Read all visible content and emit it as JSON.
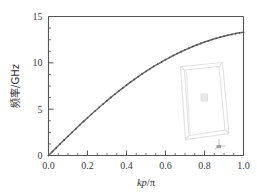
{
  "figure": {
    "background_color": "#ffffff",
    "frame_color": "#555555",
    "curve_color": "#6b6b6b",
    "marker_color": "#4a4a4a",
    "inset_color": "#dcdcdc"
  },
  "chart_data": {
    "type": "line",
    "title": "",
    "subtitle": "",
    "xlabel": "kp/π",
    "xlabel_parts": {
      "italic": "kp",
      "slash": "/",
      "symbol": "π"
    },
    "ylabel": "频率/GHz",
    "xlim": [
      0.0,
      1.0
    ],
    "ylim": [
      0,
      15
    ],
    "xticks": [
      0.0,
      0.2,
      0.4,
      0.6,
      0.8,
      1.0
    ],
    "xticklabels": [
      "0.0",
      "0.2",
      "0.4",
      "0.6",
      "0.8",
      "1.0"
    ],
    "yticks": [
      0,
      5,
      10,
      15
    ],
    "yticklabels": [
      "0",
      "5",
      "10",
      "15"
    ],
    "x_minor_ticks": [
      0.05,
      0.1,
      0.15,
      0.25,
      0.3,
      0.35,
      0.45,
      0.5,
      0.55,
      0.65,
      0.7,
      0.75,
      0.85,
      0.9,
      0.95
    ],
    "y_minor_ticks": [
      1.25,
      2.5,
      3.75,
      6.25,
      7.5,
      8.75,
      11.25,
      12.5,
      13.75
    ],
    "grid": false,
    "legend": null,
    "legend_position": "none",
    "series": [
      {
        "name": "dispersion",
        "marker": "dot",
        "x": [
          0.0,
          0.02,
          0.04,
          0.06,
          0.08,
          0.1,
          0.12,
          0.14,
          0.16,
          0.18,
          0.2,
          0.22,
          0.24,
          0.26,
          0.28,
          0.3,
          0.32,
          0.34,
          0.36,
          0.38,
          0.4,
          0.42,
          0.44,
          0.46,
          0.48,
          0.5,
          0.52,
          0.54,
          0.56,
          0.58,
          0.6,
          0.62,
          0.64,
          0.66,
          0.68,
          0.7,
          0.72,
          0.74,
          0.76,
          0.78,
          0.8,
          0.82,
          0.84,
          0.86,
          0.88,
          0.9,
          0.92,
          0.94,
          0.96,
          0.98,
          1.0
        ],
        "y": [
          0.0,
          0.42,
          0.84,
          1.26,
          1.67,
          2.08,
          2.49,
          2.89,
          3.29,
          3.68,
          4.07,
          4.45,
          4.83,
          5.2,
          5.56,
          5.92,
          6.27,
          6.61,
          6.95,
          7.28,
          7.6,
          7.91,
          8.21,
          8.51,
          8.8,
          9.08,
          9.35,
          9.61,
          9.86,
          10.11,
          10.34,
          10.57,
          10.79,
          11.0,
          11.2,
          11.4,
          11.58,
          11.76,
          11.93,
          12.09,
          12.24,
          12.38,
          12.52,
          12.65,
          12.77,
          12.88,
          12.98,
          13.07,
          13.16,
          13.24,
          13.3
        ]
      }
    ],
    "annotations": [
      {
        "name": "unit-cell-inset",
        "type": "wireframe-box",
        "description": "faint 3D wireframe unit cell with small central square",
        "x_range": [
          0.62,
          0.94
        ],
        "y_range": [
          1.0,
          10.6
        ]
      },
      {
        "name": "inset-axis-triad",
        "type": "axis-indicator",
        "description": "tiny coordinate axis triad at lower right of inset"
      }
    ]
  }
}
